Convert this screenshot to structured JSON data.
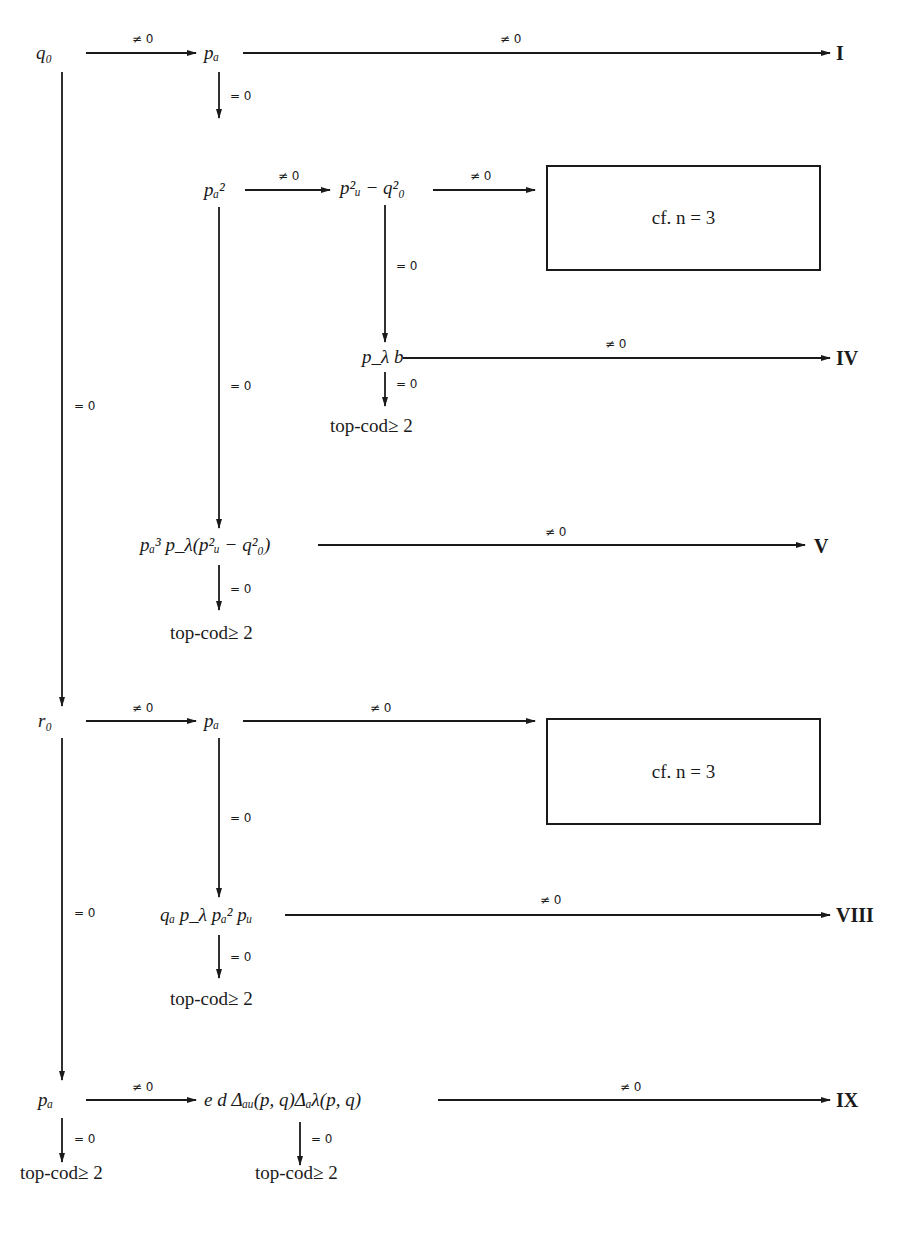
{
  "diagram": {
    "nodes": {
      "q0": "q₀",
      "pa_1": "pₐ",
      "pa2": "pₐ²",
      "pu2_minus_q02": "p²ᵤ − q²₀",
      "plambda_b": "p_λ b",
      "pa3_expr": "pₐ³ p_λ(p²ᵤ − q²₀)",
      "r0": "r₀",
      "pa_2": "pₐ",
      "qa_expr": "qₐ p_λ pₐ² pᵤ",
      "pa_3": "pₐ",
      "e_d_delta": "e d Δₐᵤ(p, q)Δₐλ(p, q)"
    },
    "outcomes": {
      "I": "I",
      "IV": "IV",
      "V": "V",
      "VIII": "VIII",
      "IX": "IX"
    },
    "boxes": {
      "box_1": "cf. n = 3",
      "box_2": "cf. n = 3"
    },
    "terminals": {
      "t1": "top-cod≥ 2",
      "t2": "top-cod≥ 2",
      "t3": "top-cod≥ 2",
      "t4": "top-cod≥ 2",
      "t5": "top-cod≥ 2"
    },
    "conditions": {
      "nonzero": "≠ 0",
      "zero": "= 0"
    },
    "edges": [
      {
        "from": "q0",
        "to": "pa_1",
        "label": "≠ 0"
      },
      {
        "from": "pa_1",
        "to": "I",
        "label": "≠ 0"
      },
      {
        "from": "pa_1",
        "to": "pa2",
        "label": "= 0"
      },
      {
        "from": "pa2",
        "to": "pu2_minus_q02",
        "label": "≠ 0"
      },
      {
        "from": "pu2_minus_q02",
        "to": "box_1",
        "label": "≠ 0"
      },
      {
        "from": "pu2_minus_q02",
        "to": "plambda_b",
        "label": "= 0"
      },
      {
        "from": "plambda_b",
        "to": "IV",
        "label": "≠ 0"
      },
      {
        "from": "plambda_b",
        "to": "t1",
        "label": "= 0"
      },
      {
        "from": "pa2",
        "to": "pa3_expr",
        "label": "= 0"
      },
      {
        "from": "pa3_expr",
        "to": "V",
        "label": "≠ 0"
      },
      {
        "from": "pa3_expr",
        "to": "t2",
        "label": "= 0"
      },
      {
        "from": "q0",
        "to": "r0",
        "label": "= 0"
      },
      {
        "from": "r0",
        "to": "pa_2",
        "label": "≠ 0"
      },
      {
        "from": "pa_2",
        "to": "box_2",
        "label": "≠ 0"
      },
      {
        "from": "pa_2",
        "to": "qa_expr",
        "label": "= 0"
      },
      {
        "from": "qa_expr",
        "to": "VIII",
        "label": "≠ 0"
      },
      {
        "from": "qa_expr",
        "to": "t3",
        "label": "= 0"
      },
      {
        "from": "r0",
        "to": "pa_3",
        "label": "= 0"
      },
      {
        "from": "pa_3",
        "to": "e_d_delta",
        "label": "≠ 0"
      },
      {
        "from": "pa_3",
        "to": "t4",
        "label": "= 0"
      },
      {
        "from": "e_d_delta",
        "to": "IX",
        "label": "≠ 0"
      },
      {
        "from": "e_d_delta",
        "to": "t5",
        "label": "= 0"
      }
    ]
  }
}
